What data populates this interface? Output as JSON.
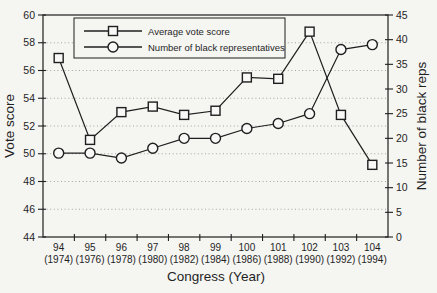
{
  "figure": {
    "background": "#f5f5f2"
  },
  "chart_data": {
    "type": "line",
    "title": "",
    "xlabel": "Congress (Year)",
    "ylabel_left": "Vote score",
    "ylabel_right": "Number of black reps",
    "categories": [
      {
        "congress": "94",
        "year": "(1974)"
      },
      {
        "congress": "95",
        "year": "(1976)"
      },
      {
        "congress": "96",
        "year": "(1978)"
      },
      {
        "congress": "97",
        "year": "(1980)"
      },
      {
        "congress": "98",
        "year": "(1982)"
      },
      {
        "congress": "99",
        "year": "(1984)"
      },
      {
        "congress": "100",
        "year": "(1986)"
      },
      {
        "congress": "101",
        "year": "(1988)"
      },
      {
        "congress": "102",
        "year": "(1990)"
      },
      {
        "congress": "103",
        "year": "(1992)"
      },
      {
        "congress": "104",
        "year": "(1994)"
      }
    ],
    "left_axis": {
      "label": "Vote score",
      "min": 44,
      "max": 60,
      "step": 2
    },
    "right_axis": {
      "label": "Number of black reps",
      "min": 0,
      "max": 45,
      "step": 5
    },
    "grid": {
      "horizontal": true,
      "style": "dotted",
      "at_left_ticks": true
    },
    "legend": {
      "position": "top-left-inside"
    },
    "series": [
      {
        "name": "Average vote score",
        "axis": "left",
        "marker": "square",
        "values": [
          56.9,
          51.0,
          53.0,
          53.4,
          52.8,
          53.1,
          55.5,
          55.4,
          58.8,
          52.8,
          49.2
        ]
      },
      {
        "name": "Number of black representatives",
        "axis": "right",
        "marker": "circle",
        "values": [
          17,
          17,
          16,
          18,
          20,
          20,
          22,
          23,
          25,
          38,
          39
        ]
      }
    ],
    "colors": {
      "line": "#1f1f1f",
      "marker_fill": "#f8f8f6",
      "grid": "#9a9a9a",
      "text": "#1f1f1f",
      "background": "#f5f5f2"
    }
  }
}
